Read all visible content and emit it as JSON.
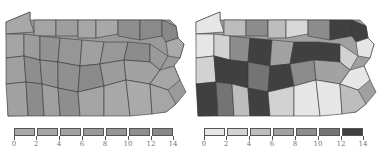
{
  "maps": [
    {
      "id": "left",
      "region": "Pennsylvania counties",
      "legend": {
        "ticks": [
          "0",
          "2",
          "4",
          "6",
          "8",
          "10",
          "12",
          "14"
        ],
        "colors": [
          "#a9a9a9",
          "#a5a5a5",
          "#a2a2a2",
          "#9a9a9a",
          "#969696",
          "#8f8f8f",
          "#888888"
        ]
      }
    },
    {
      "id": "right",
      "region": "Pennsylvania counties",
      "legend": {
        "ticks": [
          "0",
          "2",
          "4",
          "6",
          "8",
          "10",
          "12",
          "14"
        ],
        "colors": [
          "#e6e6e6",
          "#d2d2d2",
          "#bdbdbd",
          "#a2a2a2",
          "#8c8c8c",
          "#747474",
          "#404040"
        ]
      }
    }
  ]
}
